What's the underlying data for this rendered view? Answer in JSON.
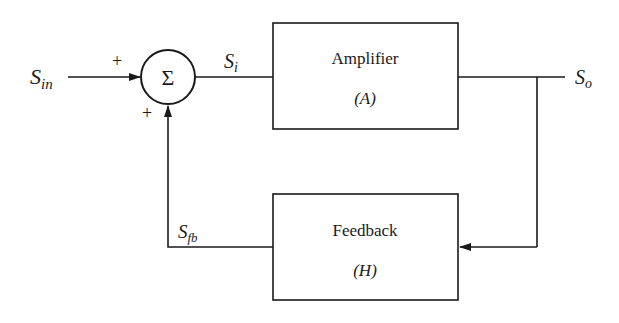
{
  "diagram": {
    "type": "feedback-block-diagram",
    "colors": {
      "stroke": "#1a1a1a",
      "background": "#ffffff"
    },
    "signals": {
      "input": {
        "main": "S",
        "sub": "in"
      },
      "error": {
        "main": "S",
        "sub": "i"
      },
      "output": {
        "main": "S",
        "sub": "o"
      },
      "feedback": {
        "main": "S",
        "sub": "fb"
      }
    },
    "summing_junction": {
      "symbol": "Σ",
      "input_sign_top": "+",
      "input_sign_bottom": "+"
    },
    "blocks": {
      "amplifier": {
        "title": "Amplifier",
        "symbol": "(A)"
      },
      "feedback": {
        "title": "Feedback",
        "symbol": "(H)"
      }
    }
  }
}
